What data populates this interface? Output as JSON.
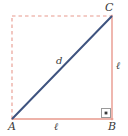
{
  "figure": {
    "background_color": "#ffffff",
    "canvas": {
      "width": 128,
      "height": 136
    },
    "colors": {
      "solid_side": "#e8998d",
      "dashed_side": "#e8998d",
      "diagonal": "#3f5480",
      "label_text": "#3a3a3a",
      "right_angle_mark": "#6b6b6b",
      "right_angle_dot": "#3a3a3a"
    },
    "vertices": [
      {
        "name": "A",
        "label": "A",
        "x": 12,
        "y": 119,
        "position": "bottom-left"
      },
      {
        "name": "B",
        "label": "B",
        "x": 112,
        "y": 119,
        "position": "bottom-right"
      },
      {
        "name": "C",
        "label": "C",
        "x": 112,
        "y": 16,
        "position": "top-right"
      }
    ],
    "edges": [
      {
        "name": "bottom-edge",
        "from": "A",
        "to": "B",
        "style": "solid",
        "label": "ℓ"
      },
      {
        "name": "right-edge",
        "from": "B",
        "to": "C",
        "style": "solid",
        "label": "ℓ"
      },
      {
        "name": "left-edge",
        "from": "A",
        "to": "D",
        "style": "dashed",
        "label": ""
      },
      {
        "name": "top-edge",
        "from": "D",
        "to": "C",
        "style": "dashed",
        "label": ""
      },
      {
        "name": "diagonal",
        "from": "A",
        "to": "C",
        "style": "solid",
        "label": "d"
      }
    ],
    "labels": {
      "vertex_a": "A",
      "vertex_b": "B",
      "vertex_c": "C",
      "side_bottom": "ℓ",
      "side_right": "ℓ",
      "diagonal": "d"
    },
    "right_angle_marker": {
      "name": "right-angle-mark-at-B",
      "vertex": "B",
      "x": 101,
      "y": 108,
      "size": 10,
      "has_center_dot": true
    }
  }
}
